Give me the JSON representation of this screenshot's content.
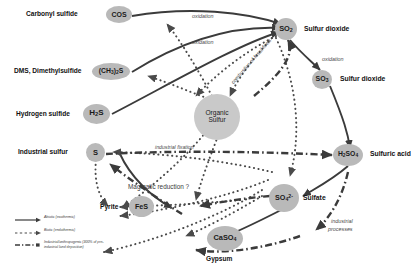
{
  "diagram": {
    "type": "biogeochemical-cycle"
  },
  "nodes": [
    {
      "id": "cos",
      "formula": "COS",
      "label": "Carbonyl sulfide",
      "label_side": "left"
    },
    {
      "id": "dms",
      "formula": "(CH3)2S",
      "label": "DMS, Dimethylsulfide",
      "label_side": "left"
    },
    {
      "id": "h2s",
      "formula": "H2S",
      "label": "Hydrogen sulfide",
      "label_side": "left"
    },
    {
      "id": "s",
      "formula": "S",
      "label": "Industrial sulfur",
      "label_side": "left"
    },
    {
      "id": "fes",
      "formula": "FeS",
      "label": "Pyrite",
      "label_side": "left"
    },
    {
      "id": "caso4",
      "formula": "CaSO4",
      "label": "Gypsum",
      "label_side": "below"
    },
    {
      "id": "orgs",
      "formula": "Organic Sulfur",
      "label": "",
      "label_side": "none"
    },
    {
      "id": "so2",
      "formula": "SO2",
      "label": "Sulfur dioxide",
      "label_side": "right"
    },
    {
      "id": "so3",
      "formula": "SO3",
      "label": "Sulfur dioxide",
      "label_side": "right"
    },
    {
      "id": "h2so4",
      "formula": "H2SO4",
      "label": "Sulfuric acid",
      "label_side": "right"
    },
    {
      "id": "so4",
      "formula": "SO4",
      "label": "Sulfate",
      "label_side": "right"
    }
  ],
  "node_text": {
    "cos": "COS",
    "dms_a": "(CH",
    "dms_b": "3",
    "dms_c": ")",
    "dms_d": "2",
    "dms_e": "S",
    "h2s_a": "H",
    "h2s_b": "2",
    "h2s_c": "S",
    "s": "S",
    "fes": "FeS",
    "caso4_a": "CaSO",
    "caso4_b": "4",
    "orgs_l1": "Organic",
    "orgs_l2": "Sulfur",
    "so2_a": "SO",
    "so2_b": "2",
    "so3_a": "SO",
    "so3_b": "3",
    "h2so4_a": "H",
    "h2so4_b": "2",
    "h2so4_c": "SO",
    "h2so4_d": "4",
    "so4_a": "SO",
    "so4_b": "4",
    "so4_c": "2-"
  },
  "node_labels": {
    "cos": "Carbonyl sulfide",
    "dms": "DMS, Dimethylsulfide",
    "h2s": "Hydrogen sulfide",
    "s": "Industrial sulfur",
    "fes": "Pyrite",
    "caso4": "Gypsum",
    "so2": "Sulfur dioxide",
    "so3": "Sulfur dioxide",
    "h2so4": "Sulfuric acid",
    "so4": "Sulfate"
  },
  "edge_labels": {
    "oxidation_1": "oxidation",
    "oxidation_2": "oxidation",
    "oxidation_3": "oxidation",
    "combustion": "combustion of fossil fuels",
    "industrial_fixation": "industrial fixation",
    "magmatic_reduction": "Magmatic reduction ?",
    "industrial_processes_l1": "industrial",
    "industrial_processes_l2": "processes"
  },
  "legend": {
    "items": [
      {
        "id": "abiotic",
        "style": "solid",
        "text": "Abiotic (exothermic)"
      },
      {
        "id": "biotic",
        "style": "dotted",
        "text": "Biotic (endothermic)"
      },
      {
        "id": "industrial",
        "style": "dash-dot",
        "text": "Industrial/anthropogenic (300% of pre-industrial land deposition)"
      }
    ]
  },
  "colors": {
    "node_fill": "#b9b9b9",
    "node_fill_light": "#c9c9c9",
    "abiotic_line": "#3b3b3b",
    "biotic_line": "#4a4a4a",
    "industrial_line": "#3b3b3b",
    "label_text": "#111111",
    "edge_label_text": "#4a4a4a",
    "background": "#ffffff"
  }
}
